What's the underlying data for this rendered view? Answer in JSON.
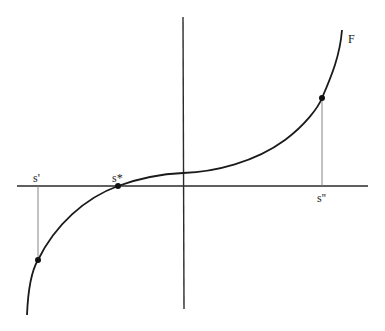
{
  "figure": {
    "type": "function-graph",
    "curve_label": "F",
    "points": {
      "s_prime": {
        "label": "s'",
        "axis_x": 38,
        "curve_y": 260
      },
      "s_star": {
        "label": "s*",
        "axis_x": 118,
        "curve_y": 186
      },
      "s_double_prime": {
        "label": "s''",
        "axis_x": 322,
        "curve_y": 98
      }
    },
    "colors": {
      "curve": "#1a1a1a",
      "axis": "#2a2a2a",
      "dropline": "#777777",
      "point": "#111111"
    }
  }
}
